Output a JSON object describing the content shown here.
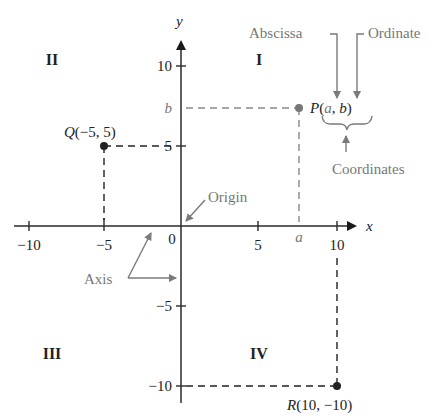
{
  "diagram": {
    "type": "cartesian-coordinate-plane",
    "axes": {
      "x_label": "x",
      "y_label": "y",
      "origin_label": "0",
      "x_ticks": [
        "−10",
        "−5",
        "5",
        "10"
      ],
      "x_tick_values": [
        -10,
        -5,
        5,
        10
      ],
      "y_ticks": [
        "10",
        "5",
        "−5",
        "−10"
      ],
      "y_tick_values": [
        10,
        5,
        -5,
        -10
      ],
      "x_symbol": "a",
      "y_symbol": "b"
    },
    "quadrants": {
      "q1": "I",
      "q2": "II",
      "q3": "III",
      "q4": "IV"
    },
    "points": {
      "P": {
        "label": "P(a, b)",
        "label_prefix": "P(",
        "a": "a",
        "comma": ", ",
        "b": "b",
        "suffix": ")",
        "color": "#777777"
      },
      "Q": {
        "label": "Q(−5, 5)",
        "x": -5,
        "y": 5,
        "color": "#222222"
      },
      "R": {
        "label": "R(10, −10)",
        "x": 10,
        "y": -10,
        "color": "#222222"
      }
    },
    "annotations": {
      "abscissa": "Abscissa",
      "ordinate": "Ordinate",
      "coordinates": "Coordinates",
      "origin": "Origin",
      "axis": "Axis"
    },
    "colors": {
      "axis": "#2a2a2a",
      "annotation": "#777777",
      "background": "#ffffff"
    }
  }
}
